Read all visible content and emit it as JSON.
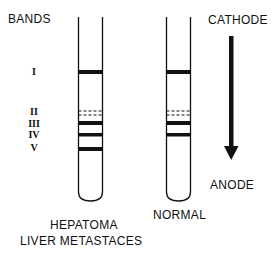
{
  "title_left": "BANDS",
  "title_right": "CATHODE",
  "anode_label": "ANODE",
  "band_labels": [
    "I",
    "II",
    "III",
    "IV",
    "V"
  ],
  "tubes": [
    {
      "label_lines": [
        "HEPATOMA",
        "LIVER METASTACES"
      ],
      "bands": [
        {
          "name": "I",
          "style": "solid"
        },
        {
          "name": "II",
          "style": "dashed"
        },
        {
          "name": "III",
          "style": "solid"
        },
        {
          "name": "IV",
          "style": "solid"
        },
        {
          "name": "V",
          "style": "solid"
        }
      ]
    },
    {
      "label_lines": [
        "NORMAL"
      ],
      "bands": [
        {
          "name": "I",
          "style": "solid"
        },
        {
          "name": "II",
          "style": "dashed"
        },
        {
          "name": "III",
          "style": "solid"
        },
        {
          "name": "IV",
          "style": "solid"
        }
      ]
    }
  ],
  "direction": "cathode-to-anode",
  "colors": {
    "ink": "#111111",
    "background": "#ffffff"
  }
}
